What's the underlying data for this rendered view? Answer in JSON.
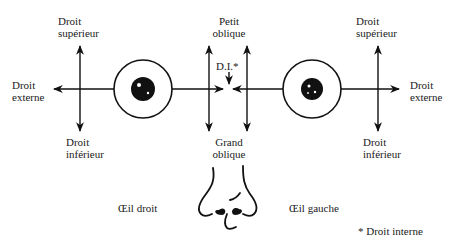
{
  "diagram": {
    "left_eye": {
      "name": "Œil droit",
      "labels": {
        "top": "Droit\nsupérieur",
        "outer": "Droit\nexterne",
        "bottom": "Droit\ninférieur"
      }
    },
    "right_eye": {
      "name": "Œil gauche",
      "labels": {
        "top": "Droit\nsupérieur",
        "outer": "Droit\nexterne",
        "bottom": "Droit\ninférieur"
      }
    },
    "center": {
      "top": "Petit\noblique",
      "inner": "D.I.*",
      "bottom": "Grand\noblique"
    },
    "footnote": "* Droit interne",
    "colors": {
      "ink": "#111111",
      "background": "#ffffff"
    }
  }
}
